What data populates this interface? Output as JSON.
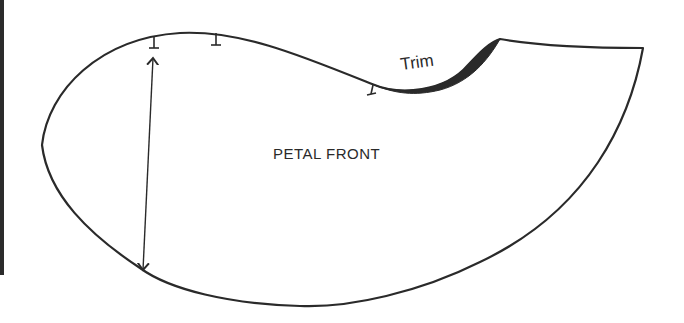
{
  "diagram": {
    "title": "PETAL FRONT",
    "labels": {
      "piece_name": "PETAL FRONT",
      "trim_label": "Trim"
    },
    "colors": {
      "outline": "#2a2a2a",
      "trim_fill": "#2a2a2a",
      "background": "#ffffff",
      "left_bar": "#2b2b2b"
    },
    "elements": [
      {
        "type": "pattern-outline",
        "description": "petal front pattern piece outline"
      },
      {
        "type": "trim-region",
        "description": "shaded crescent to be trimmed along the upper notch"
      },
      {
        "type": "grainline-arrow",
        "description": "double-headed measurement/grain arrow on left side"
      },
      {
        "type": "tick-marks",
        "count": 3,
        "description": "placement marks along top edge"
      }
    ]
  }
}
